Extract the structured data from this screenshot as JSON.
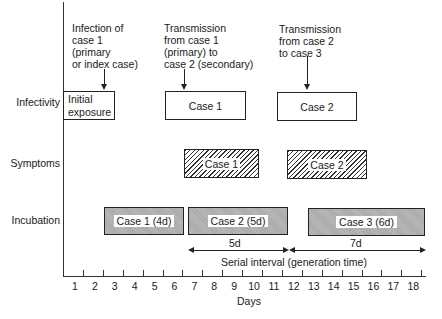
{
  "annotations": {
    "infection_case1": [
      "Infection of",
      "case 1",
      "(primary",
      "or index case)"
    ],
    "transmission_1_2": [
      "Transmission",
      "from case 1",
      "(primary) to",
      "case 2 (secondary)"
    ],
    "transmission_2_3": [
      "Transmission",
      "from case 2",
      "to case 3"
    ]
  },
  "rows": {
    "infectivity": "Infectivity",
    "symptoms": "Symptoms",
    "incubation": "Incubation"
  },
  "boxes": {
    "initial_exposure": [
      "Initial",
      "exposure"
    ],
    "infectivity_case1": "Case 1",
    "infectivity_case2": "Case 2",
    "symptoms_case1": "Case 1",
    "symptoms_case2": "Case 2",
    "incubation_case1": "Case 1 (4d)",
    "incubation_case2": "Case 2 (5d)",
    "incubation_case3": "Case 3 (6d)"
  },
  "intervals": {
    "first": "5d",
    "second": "7d",
    "label": "Serial interval (generation time)"
  },
  "axis": {
    "xlabel": "Days",
    "days": [
      "1",
      "2",
      "3",
      "4",
      "5",
      "6",
      "7",
      "8",
      "9",
      "10",
      "11",
      "12",
      "13",
      "14",
      "15",
      "16",
      "17",
      "18"
    ]
  },
  "chart_data": {
    "type": "timeline",
    "xlabel": "Days",
    "x_range": [
      1,
      18
    ],
    "rows": [
      "Infectivity",
      "Symptoms",
      "Incubation"
    ],
    "bars": [
      {
        "row": "Infectivity",
        "label": "Initial exposure",
        "start": 0.5,
        "end": 3,
        "style": "plain"
      },
      {
        "row": "Infectivity",
        "label": "Case 1",
        "start": 6,
        "end": 10,
        "style": "plain"
      },
      {
        "row": "Infectivity",
        "label": "Case 2",
        "start": 11.5,
        "end": 15.5,
        "style": "plain"
      },
      {
        "row": "Symptoms",
        "label": "Case 1",
        "start": 6.5,
        "end": 10.5,
        "style": "hatched"
      },
      {
        "row": "Symptoms",
        "label": "Case 2",
        "start": 11.5,
        "end": 15.5,
        "style": "hatched"
      },
      {
        "row": "Incubation",
        "label": "Case 1 (4d)",
        "start": 2.5,
        "end": 6.5,
        "style": "shaded"
      },
      {
        "row": "Incubation",
        "label": "Case 2 (5d)",
        "start": 6.5,
        "end": 11.5,
        "style": "shaded"
      },
      {
        "row": "Incubation",
        "label": "Case 3 (6d)",
        "start": 12.5,
        "end": 18,
        "style": "shaded"
      }
    ],
    "serial_intervals": [
      {
        "label": "5d",
        "start": 6.5,
        "end": 11.5
      },
      {
        "label": "7d",
        "start": 11.5,
        "end": 18.5
      }
    ],
    "serial_interval_label": "Serial interval (generation time)",
    "annotations": [
      {
        "text": "Infection of case 1 (primary or index case)",
        "x": 3
      },
      {
        "text": "Transmission from case 1 (primary) to case 2 (secondary)",
        "x": 6
      },
      {
        "text": "Transmission from case 2 to case 3",
        "x": 12.5
      }
    ]
  }
}
